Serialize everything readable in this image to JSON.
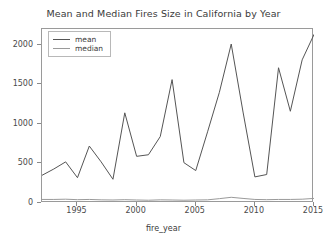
{
  "chart_data": {
    "type": "line",
    "title": "Mean and Median Fires Size in California by Year",
    "xlabel": "fire_year",
    "ylabel": "",
    "grid": false,
    "legend_position": "upper left",
    "xlim": [
      1992,
      2015
    ],
    "ylim": [
      0,
      2200
    ],
    "xticks": [
      1995,
      2000,
      2005,
      2010,
      2015
    ],
    "yticks": [
      0,
      500,
      1000,
      1500,
      2000
    ],
    "x": [
      1992,
      1993,
      1994,
      1995,
      1996,
      1997,
      1998,
      1999,
      2000,
      2001,
      2002,
      2003,
      2004,
      2005,
      2006,
      2007,
      2008,
      2009,
      2010,
      2011,
      2012,
      2013,
      2014,
      2015
    ],
    "series": [
      {
        "name": "mean",
        "color": "#555555",
        "values": [
          350,
          430,
          520,
          320,
          720,
          520,
          300,
          1140,
          590,
          610,
          840,
          1560,
          510,
          410,
          900,
          1400,
          2010,
          1150,
          330,
          360,
          1710,
          1160,
          1810,
          2130
        ]
      },
      {
        "name": "median",
        "color": "#9a9a9a",
        "values": [
          45,
          45,
          48,
          42,
          45,
          40,
          38,
          42,
          38,
          35,
          40,
          38,
          35,
          38,
          40,
          55,
          72,
          58,
          45,
          42,
          45,
          45,
          48,
          58
        ]
      }
    ]
  },
  "legend": {
    "entries": [
      {
        "label": "mean"
      },
      {
        "label": "median"
      }
    ]
  },
  "axes": {
    "ytick_labels": [
      "0",
      "500",
      "1000",
      "1500",
      "2000"
    ],
    "xtick_labels": [
      "1995",
      "2000",
      "2005",
      "2010",
      "2015"
    ]
  }
}
